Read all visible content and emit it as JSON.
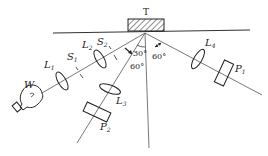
{
  "diagram": {
    "target_label": "T",
    "source_label": "W",
    "lenses": [
      {
        "id": "L1",
        "letter": "L",
        "sub": "1"
      },
      {
        "id": "L2",
        "letter": "L",
        "sub": "2"
      },
      {
        "id": "L3",
        "letter": "L",
        "sub": "3"
      },
      {
        "id": "L4",
        "letter": "L",
        "sub": "4"
      }
    ],
    "slits": [
      {
        "id": "S1",
        "letter": "S",
        "sub": "1"
      },
      {
        "id": "S2",
        "letter": "S",
        "sub": "2"
      }
    ],
    "polarizers": [
      {
        "id": "P1",
        "letter": "P",
        "sub": "1"
      },
      {
        "id": "P2",
        "letter": "P",
        "sub": "2"
      }
    ],
    "angles": {
      "left_inner": "30°",
      "left_outer": "60°",
      "right": "60°"
    },
    "colors": {
      "line": "#555555",
      "stroke": "#222222",
      "background": "#ffffff"
    }
  }
}
